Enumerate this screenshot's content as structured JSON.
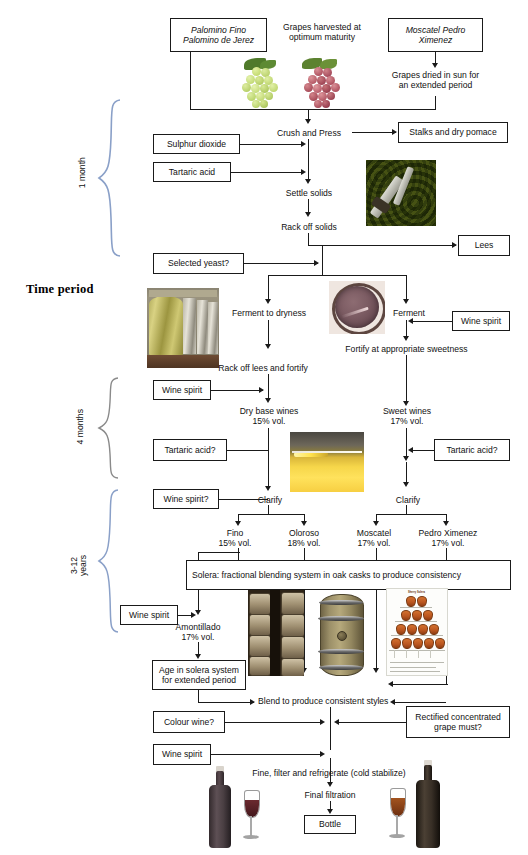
{
  "diagram": {
    "axis_title": "Time period",
    "time_periods": [
      {
        "id": "p1",
        "label": "1 month"
      },
      {
        "id": "p2",
        "label": "4 months"
      },
      {
        "id": "p3",
        "label": "3-12\nyears"
      }
    ],
    "boxes": [
      {
        "id": "b_palomino",
        "text": "Palomino Fino\nPalomino de Jerez"
      },
      {
        "id": "b_moscatel",
        "text": "Moscatel\nPedro Ximenez"
      },
      {
        "id": "b_stalks",
        "text": "Stalks and dry pomace"
      },
      {
        "id": "b_so2",
        "text": "Sulphur dioxide"
      },
      {
        "id": "b_tartaric1",
        "text": "Tartaric acid"
      },
      {
        "id": "b_lees",
        "text": "Lees"
      },
      {
        "id": "b_yeast",
        "text": "Selected yeast?"
      },
      {
        "id": "b_spirit1",
        "text": "Wine spirit"
      },
      {
        "id": "b_spirit2",
        "text": "Wine spirit"
      },
      {
        "id": "b_tartaric2",
        "text": "Tartaric acid?"
      },
      {
        "id": "b_tartaric3",
        "text": "Tartaric acid?"
      },
      {
        "id": "b_spirit3",
        "text": "Wine spirit?"
      },
      {
        "id": "b_solera",
        "text": "Solera: fractional blending system in oak casks to produce consistency"
      },
      {
        "id": "b_spirit4",
        "text": "Wine spirit"
      },
      {
        "id": "b_age",
        "text": "Age in solera system\nfor extended period"
      },
      {
        "id": "b_colour",
        "text": "Colour wine?"
      },
      {
        "id": "b_rcgm",
        "text": "Rectified concentrated\ngrape must?"
      },
      {
        "id": "b_spirit5",
        "text": "Wine spirit"
      },
      {
        "id": "b_bottle",
        "text": "Bottle"
      }
    ],
    "labels": [
      {
        "id": "l_harvest",
        "text": "Grapes harvested at\noptimum maturity"
      },
      {
        "id": "l_sundried",
        "text": "Grapes dried in sun for\nan extended period"
      },
      {
        "id": "l_crush",
        "text": "Crush and Press"
      },
      {
        "id": "l_settle",
        "text": "Settle solids"
      },
      {
        "id": "l_rackoff",
        "text": "Rack off solids"
      },
      {
        "id": "l_fermdry",
        "text": "Ferment to dryness"
      },
      {
        "id": "l_ferment",
        "text": "Ferment"
      },
      {
        "id": "l_fortify",
        "text": "Fortify at appropriate sweetness"
      },
      {
        "id": "l_racklees",
        "text": "Rack off lees and fortify"
      },
      {
        "id": "l_drybase",
        "text": "Dry base wines\n15% vol."
      },
      {
        "id": "l_sweet",
        "text": "Sweet wines\n17% vol."
      },
      {
        "id": "l_clarify1",
        "text": "Clarify"
      },
      {
        "id": "l_clarify2",
        "text": "Clarify"
      },
      {
        "id": "l_fino",
        "text": "Fino\n15% vol."
      },
      {
        "id": "l_oloroso",
        "text": "Oloroso\n18% vol."
      },
      {
        "id": "l_moscatel",
        "text": "Moscatel\n17% vol."
      },
      {
        "id": "l_px",
        "text": "Pedro Ximenez\n17% vol."
      },
      {
        "id": "l_amont",
        "text": "Amontillado\n17% vol."
      },
      {
        "id": "l_blend",
        "text": "Blend to produce consistent styles"
      },
      {
        "id": "l_fine",
        "text": "Fine, filter and refrigerate (cold stabilize)"
      },
      {
        "id": "l_final",
        "text": "Final filtration"
      }
    ],
    "images": [
      {
        "id": "img_green_grapes",
        "name": "green-grapes-photo"
      },
      {
        "id": "img_red_grapes",
        "name": "red-grapes-photo"
      },
      {
        "id": "img_lees_skins",
        "name": "grape-skins-pressing-photo"
      },
      {
        "id": "img_tanks",
        "name": "fermentation-tanks-photo"
      },
      {
        "id": "img_must_vat",
        "name": "fermenting-must-vat-photo"
      },
      {
        "id": "img_gold_wine",
        "name": "golden-wine-photo"
      },
      {
        "id": "img_cask_stack",
        "name": "cask-stack-photo"
      },
      {
        "id": "img_oak_cask",
        "name": "oak-cask-photo"
      },
      {
        "id": "img_solera_pyramid",
        "name": "solera-pyramid-diagram"
      },
      {
        "id": "img_bottle_left",
        "name": "sherry-bottle-left-photo"
      },
      {
        "id": "img_glass_left",
        "name": "sherry-glass-left-photo"
      },
      {
        "id": "img_bottle_right",
        "name": "sherry-bottle-right-photo"
      },
      {
        "id": "img_glass_right",
        "name": "sherry-glass-right-photo"
      }
    ],
    "colors": {
      "line": "#1a1a1a",
      "brace": "#8aa0c8",
      "box_border": "#1a1a1a",
      "background": "#ffffff"
    }
  }
}
